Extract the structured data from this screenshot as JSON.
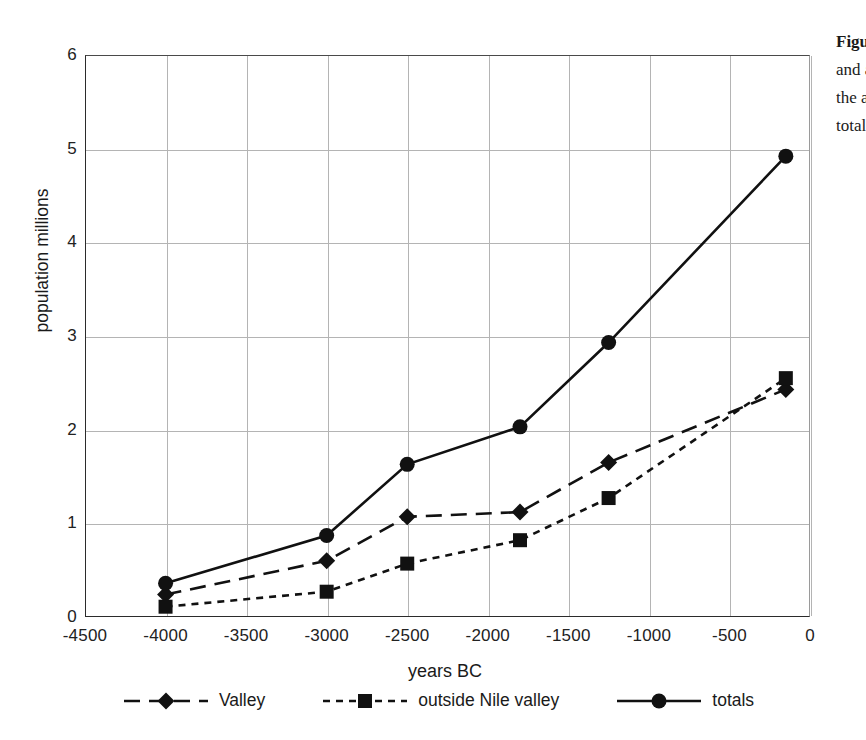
{
  "figure": {
    "side_caption": {
      "line1": "Figure 1 Estimated population of the Nile",
      "line2": "and adjacent regions, showing valley,",
      "line3": "the area outside the Nile valley, and",
      "line4": "totals in millions."
    }
  },
  "chart_data": {
    "type": "line",
    "title": "",
    "xlabel": "years BC",
    "ylabel": "population millions",
    "xlim": [
      -4500,
      0
    ],
    "ylim": [
      0,
      6
    ],
    "xticks": [
      "-4500",
      "-4000",
      "-3500",
      "-3000",
      "-2500",
      "-2000",
      "-1500",
      "-1000",
      "-500",
      "0"
    ],
    "xtick_values": [
      -4500,
      -4000,
      -3500,
      -3000,
      -2500,
      -2000,
      -1500,
      -1000,
      -500,
      0
    ],
    "yticks": [
      "0",
      "1",
      "2",
      "3",
      "4",
      "5",
      "6"
    ],
    "ytick_values": [
      0,
      1,
      2,
      3,
      4,
      5,
      6
    ],
    "grid": true,
    "legend_position": "bottom",
    "x": [
      -4000,
      -3000,
      -2500,
      -1800,
      -1250,
      -150
    ],
    "series": [
      {
        "name": "Valley",
        "marker": "diamond",
        "linestyle": "dashed",
        "color": "#111111",
        "values": [
          0.24,
          0.6,
          1.07,
          1.12,
          1.65,
          2.43
        ]
      },
      {
        "name": "outside Nile valley",
        "marker": "square",
        "linestyle": "dotted",
        "color": "#111111",
        "values": [
          0.11,
          0.27,
          0.57,
          0.82,
          1.27,
          2.55
        ]
      },
      {
        "name": "totals",
        "marker": "circle",
        "linestyle": "solid",
        "color": "#111111",
        "values": [
          0.36,
          0.87,
          1.63,
          2.03,
          2.93,
          4.92
        ]
      }
    ]
  }
}
